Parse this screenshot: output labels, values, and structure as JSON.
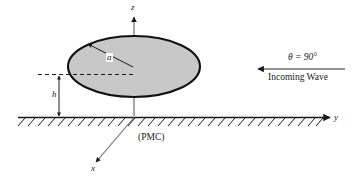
{
  "figure": {
    "type": "technical-diagram",
    "background_color": "#ffffff",
    "line_color": "#1a1a1a",
    "disk_fill_color": "#c8c8c8",
    "disk_stroke_color": "#111111"
  },
  "axes": {
    "z_label": "z",
    "y_label": "y",
    "x_label": "x"
  },
  "disk": {
    "radius_label": "a"
  },
  "height": {
    "label": "h"
  },
  "ground": {
    "label": "(PMC)"
  },
  "wave": {
    "angle_label": "θ = 90°",
    "caption": "Incoming Wave"
  }
}
